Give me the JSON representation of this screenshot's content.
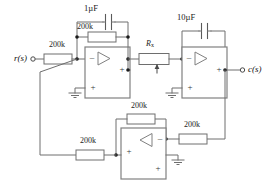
{
  "diagram": {
    "io": {
      "input_label": "r(s)",
      "output_label": "c(s)"
    },
    "components": {
      "r_input": "200k",
      "r_feedback_1": "200k",
      "c_feedback_1": "1µF",
      "r_pot": "R",
      "r_pot_sub": "x",
      "c_feedback_2": "10µF",
      "r_fb_bottom": "200k",
      "r_out_bottom": "200k",
      "r_in_bottom": "200k"
    },
    "opamp_signs": {
      "minus": "–",
      "plus": "+"
    },
    "colors": {
      "wire": "#6e6e6e",
      "opamp_outline": "#808080",
      "node_dot": "#1a1a1a",
      "text": "#1c1c1c",
      "background": "#ffffff"
    }
  }
}
